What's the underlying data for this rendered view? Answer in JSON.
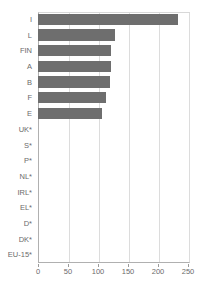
{
  "chart_data": {
    "type": "bar",
    "orientation": "horizontal",
    "title": "",
    "xlabel": "",
    "ylabel": "",
    "xlim": [
      0,
      250
    ],
    "xticks": [
      0,
      50,
      100,
      150,
      200,
      250
    ],
    "grid": true,
    "legend": false,
    "bar_color": "#6e6e6e",
    "categories": [
      "I",
      "L",
      "FIN",
      "A",
      "B",
      "F",
      "E",
      "UK*",
      "S*",
      "P*",
      "NL*",
      "IRL*",
      "EL*",
      "D*",
      "DK*",
      "EU-15*"
    ],
    "values": [
      233,
      128,
      122,
      121,
      120,
      114,
      107,
      null,
      null,
      null,
      null,
      null,
      null,
      null,
      null,
      null
    ]
  }
}
